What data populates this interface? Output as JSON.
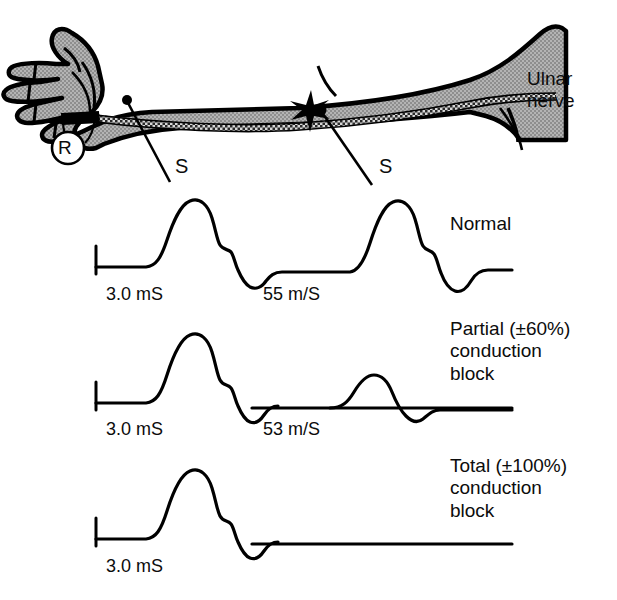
{
  "figure": {
    "anatomy": {
      "nerve_label": "Ulnar\nnerve",
      "recording_electrode_label": "R",
      "stimulator_distal_label": "S",
      "stimulator_proximal_label": "S",
      "lesion_marker": "star",
      "limb": "right forearm and hand, palmar view",
      "fill_color": "#a8a8a8",
      "outline_color": "#000000"
    },
    "traces": [
      {
        "id": "normal",
        "condition_label": "Normal",
        "distal_latency": "3.0 mS",
        "conduction_velocity": "55 m/S",
        "distal_amplitude_rel": 1.0,
        "proximal_amplitude_rel": 1.0,
        "proximal_response_present": true
      },
      {
        "id": "partial-block",
        "condition_label": "Partial (±60%)\nconduction\nblock",
        "distal_latency": "3.0 mS",
        "conduction_velocity": "53 m/S",
        "distal_amplitude_rel": 1.0,
        "proximal_amplitude_rel": 0.4,
        "proximal_response_present": true
      },
      {
        "id": "total-block",
        "condition_label": "Total (±100%)\nconduction\nblock",
        "distal_latency": "3.0 mS",
        "conduction_velocity": "",
        "distal_amplitude_rel": 1.0,
        "proximal_amplitude_rel": 0.0,
        "proximal_response_present": false
      }
    ]
  }
}
